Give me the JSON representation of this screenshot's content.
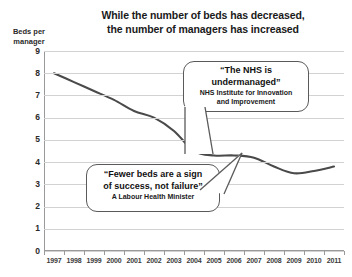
{
  "chart_data": {
    "type": "line",
    "title": "While the number of beds has decreased, the number of managers has increased",
    "title_lines": [
      "While the number of beds has decreased,",
      "the number of managers has increased"
    ],
    "ylabel": "Beds per manager",
    "ylabel_lines": [
      "Beds per",
      "manager"
    ],
    "xlabel": "",
    "ylim": [
      0,
      9
    ],
    "yticks": [
      9,
      8,
      7,
      6,
      5,
      4,
      3,
      2,
      1,
      0
    ],
    "grid": true,
    "legend": "none",
    "line_color": "#4a4a4a",
    "categories": [
      "1997",
      "1998",
      "1999",
      "2000",
      "2001",
      "2002",
      "2003",
      "2004",
      "2005",
      "2006",
      "2007",
      "2008",
      "2009",
      "2010",
      "2011"
    ],
    "x": [
      1997,
      1998,
      1999,
      2000,
      2001,
      2002,
      2003,
      2004,
      2005,
      2006,
      2007,
      2008,
      2009,
      2010,
      2011
    ],
    "values": [
      8.0,
      7.6,
      7.2,
      6.8,
      6.3,
      6.0,
      5.4,
      4.5,
      4.3,
      4.3,
      4.2,
      3.8,
      3.5,
      3.6,
      3.8
    ],
    "series": [
      {
        "name": "Beds per manager",
        "values": [
          8.0,
          7.6,
          7.2,
          6.8,
          6.3,
          6.0,
          5.4,
          4.5,
          4.3,
          4.3,
          4.2,
          3.8,
          3.5,
          3.6,
          3.8
        ]
      }
    ],
    "annotations": [
      {
        "quote_lines": [
          "“The NHS is",
          "undermanaged”"
        ],
        "attribution_lines": [
          "NHS Institute for Innovation",
          "and Improvement"
        ],
        "points_to": "2004"
      },
      {
        "quote_lines": [
          "“Fewer beds are a sign",
          "of success, not failure”"
        ],
        "attribution_lines": [
          "A Labour Health Minister"
        ],
        "points_to": "2006"
      }
    ]
  },
  "callout_1": {
    "quote_line_1": "“The NHS is",
    "quote_line_2": "undermanaged”",
    "attr_line_1": "NHS Institute for Innovation",
    "attr_line_2": "and Improvement"
  },
  "callout_2": {
    "quote_line_1": "“Fewer beds are a sign",
    "quote_line_2": "of success, not failure”",
    "attr_line_1": "A Labour Health Minister"
  }
}
